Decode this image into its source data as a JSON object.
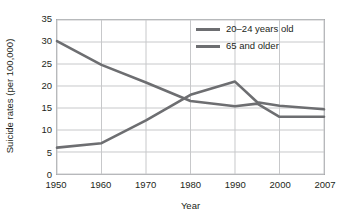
{
  "chart_data": {
    "type": "line",
    "title": "",
    "xlabel": "Year",
    "ylabel": "Suicide rates (per 100,000)",
    "categories": [
      "1950",
      "1960",
      "1970",
      "1980",
      "1990",
      "1995",
      "2000",
      "2007"
    ],
    "x_tick_labels": [
      "1950",
      "1960",
      "1970",
      "1980",
      "1990",
      "2000",
      "2007"
    ],
    "y_tick_labels": [
      "0",
      "5",
      "10",
      "15",
      "20",
      "25",
      "30",
      "35"
    ],
    "ylim": [
      0,
      35
    ],
    "ystep": 5,
    "grid": "both",
    "legend_position": "top-right",
    "series": [
      {
        "name": "20–24 years old",
        "color": "#6d6e71",
        "values": [
          6.0,
          7.0,
          12.2,
          18.0,
          21.0,
          16.3,
          15.5,
          14.7
        ]
      },
      {
        "name": "65 and older",
        "color": "#6d6e71",
        "values": [
          30.2,
          24.8,
          20.8,
          16.6,
          15.4,
          16.0,
          13.0,
          13.0
        ]
      }
    ]
  },
  "axis": {
    "y_title": "Suicide rates (per 100,000)",
    "x_title": "Year"
  },
  "legend": {
    "items": [
      {
        "label": "20–24 years old"
      },
      {
        "label": "65 and older"
      }
    ]
  },
  "colors": {
    "line": "#6d6e71",
    "grid": "#c7c8ca",
    "frame": "#a7a9ac",
    "text": "#231f20",
    "background": "#ffffff"
  }
}
